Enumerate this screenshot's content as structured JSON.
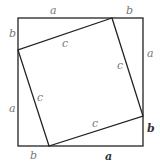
{
  "diagram": {
    "colors": {
      "line": "#222222",
      "label": "#777777",
      "label_emph": "#333333"
    },
    "outer_square": {
      "x": 18,
      "y": 18,
      "width": 125,
      "height": 128
    },
    "inner_square_points": "112,18 143,116 49,146 18,50",
    "labels": {
      "top_a": "a",
      "top_b": "b",
      "left_b": "b",
      "left_a": "a",
      "right_a": "a",
      "right_b": "b",
      "bottom_b": "b",
      "bottom_a": "a",
      "c_top": "c",
      "c_right": "c",
      "c_left": "c",
      "c_bottom": "c"
    }
  }
}
